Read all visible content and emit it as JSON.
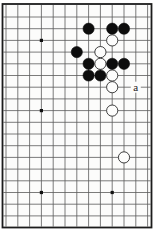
{
  "diagram": {
    "kind": "go-board-diagram",
    "label_a": "a",
    "colors": {
      "paper": "#ffffff",
      "board_paper": "#fcfcfb",
      "grid_line": "#5a5a5a",
      "frame": "#1c1c1c",
      "black_stone": "#0d0d0d",
      "white_stone_fill": "#fdfdfc",
      "white_stone_stroke": "#2a2a2a",
      "star_point": "#111111",
      "label_text": "#1a1a1a"
    }
  },
  "chart_data": {
    "type": "table",
    "board": {
      "canvas_width": 157,
      "canvas_height": 232,
      "frame": {
        "x": 2.5,
        "y": 4.0,
        "width": 149.0,
        "height": 223.5,
        "stroke_width": 1.8
      },
      "col_x": [
        6,
        17.8,
        29.6,
        41.4,
        53.2,
        65,
        76.8,
        88.6,
        100.4,
        112.2,
        124,
        135.8,
        147.6
      ],
      "row_y": [
        17,
        28.7,
        40.4,
        52.1,
        63.8,
        75.5,
        87.2,
        98.9,
        110.6,
        122.3,
        134,
        145.7,
        157.4,
        169.1,
        180.8,
        192.5,
        204.2,
        215.9
      ],
      "line_width": 0.8,
      "stone_radius": 5.6,
      "star_radius": 1.6,
      "star_points": [
        {
          "col": 4,
          "row": 3
        },
        {
          "col": 4,
          "row": 9
        },
        {
          "col": 4,
          "row": 16
        },
        {
          "col": 10,
          "row": 16
        }
      ],
      "stones": [
        {
          "col": 8,
          "row": 2,
          "color": "black"
        },
        {
          "col": 10,
          "row": 2,
          "color": "black"
        },
        {
          "col": 11,
          "row": 2,
          "color": "black"
        },
        {
          "col": 10,
          "row": 3,
          "color": "white"
        },
        {
          "col": 7,
          "row": 4,
          "color": "black"
        },
        {
          "col": 9,
          "row": 4,
          "color": "white"
        },
        {
          "col": 8,
          "row": 5,
          "color": "black"
        },
        {
          "col": 9,
          "row": 5,
          "color": "white"
        },
        {
          "col": 10,
          "row": 5,
          "color": "black"
        },
        {
          "col": 11,
          "row": 5,
          "color": "black"
        },
        {
          "col": 8,
          "row": 6,
          "color": "black"
        },
        {
          "col": 9,
          "row": 6,
          "color": "black"
        },
        {
          "col": 10,
          "row": 6,
          "color": "white"
        },
        {
          "col": 10,
          "row": 7,
          "color": "white"
        },
        {
          "col": 10,
          "row": 9,
          "color": "white"
        },
        {
          "col": 11,
          "row": 13,
          "color": "white"
        }
      ],
      "labels": [
        {
          "col": 12,
          "row": 7,
          "text": "a",
          "font_size": 11
        }
      ]
    }
  }
}
